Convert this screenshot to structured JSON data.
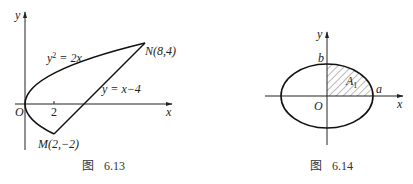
{
  "figures": [
    {
      "id": "fig-6-13",
      "caption_prefix": "图",
      "caption_number": "6.13",
      "axis_x_label": "x",
      "axis_y_label": "y",
      "origin_label": "O",
      "tick_label": "2",
      "curve_label": "y² = 2x",
      "curve_label_base": "y",
      "curve_label_exp": "2",
      "curve_label_rest": " = 2x",
      "line_label": "y = x−4",
      "point_N": "N(8,4)",
      "point_M": "M(2,−2)"
    },
    {
      "id": "fig-6-14",
      "caption_prefix": "图",
      "caption_number": "6.14",
      "axis_x_label": "x",
      "axis_y_label": "y",
      "origin_label": "O",
      "semi_major_label": "a",
      "semi_minor_label": "b",
      "region_label": "A",
      "region_subscript": "1"
    }
  ]
}
